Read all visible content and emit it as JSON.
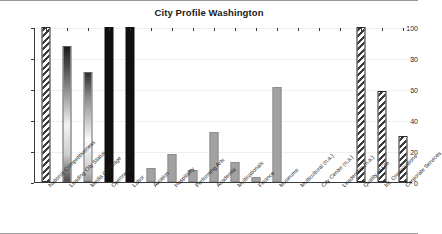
{
  "chart_data": {
    "type": "bar",
    "title": "City Profile Washington",
    "xlabel": "",
    "ylabel": "",
    "ylim": [
      0,
      100
    ],
    "yticks": [
      0,
      20,
      40,
      60,
      80,
      100
    ],
    "grid": true,
    "legend": "none",
    "categories": [
      "National Competitiveness",
      "Leading City Status",
      "Media Coverage",
      "Openness",
      "Labor",
      "Aviation",
      "Hospitality",
      "Performing Arts",
      "Academia",
      "Multinationals",
      "Finance",
      "Museums",
      "Multicultural (n.a.)",
      "City Center (n.a.)",
      "Leadership (n.a.)",
      "Quality of Life",
      "Int. Organizations",
      "Corporate Services"
    ],
    "values": [
      100,
      88,
      71,
      100,
      100,
      9,
      18,
      8,
      32,
      13,
      3,
      61,
      null,
      null,
      null,
      100,
      59,
      30
    ],
    "bar_styles": [
      "hatch",
      "grad-dark",
      "grad-light",
      "solid-black",
      "solid-black",
      "solid-gray",
      "solid-gray",
      "solid-gray",
      "solid-gray",
      "solid-gray",
      "solid-gray",
      "solid-gray",
      "none",
      "none",
      "none",
      "hatch",
      "hatch",
      "hatch"
    ]
  },
  "colors": {
    "axis": "#3a3a3a",
    "grid": "#f0f0f0",
    "hatch": "#3c3c3c",
    "solid_black": "#101010",
    "solid_gray": "#a2a2a2",
    "text": "#1a1a1a",
    "background": "#ffffff",
    "frame": "#9a9a9a"
  }
}
